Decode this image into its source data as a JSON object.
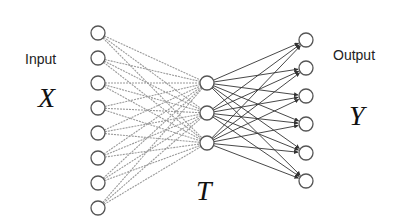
{
  "labels": {
    "input": "Input",
    "output": "Output",
    "input_var": "X",
    "output_var": "Y",
    "hidden_var": "T"
  },
  "colors": {
    "background": "#ffffff",
    "node_stroke": "#555555",
    "input_edge": "#9a9a9a",
    "output_edge": "#333333"
  },
  "network": {
    "input_layer": {
      "count": 8,
      "x": 98,
      "y": [
        33,
        58,
        83,
        108,
        133,
        158,
        183,
        208
      ]
    },
    "hidden_layer": {
      "count": 3,
      "x": 207,
      "y": [
        83,
        113,
        143
      ]
    },
    "output_layer": {
      "count": 6,
      "x": 306,
      "y": [
        40,
        68,
        96,
        124,
        153,
        181
      ]
    },
    "node_radius": 7,
    "connectivity": "fully-connected",
    "input_edges_style": "gray dashed",
    "output_edges_style": "dark arrows"
  }
}
